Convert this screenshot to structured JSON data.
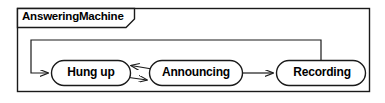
{
  "diagram": {
    "kind": "state-machine-diagram",
    "title": "AnsweringMachine",
    "frame": {
      "x": 17,
      "y": 8,
      "width": 353,
      "height": 84,
      "border_color": "#1a1a1a",
      "fill_color": "#ffffff"
    },
    "title_tab": {
      "x": 17,
      "y": 8,
      "width": 117,
      "height": 19,
      "notch": 9,
      "border_color": "#1a1a1a"
    },
    "states": [
      {
        "id": "hung-up",
        "label": "Hung up",
        "x": 51,
        "y": 60,
        "width": 80,
        "height": 26,
        "shape": "rounded-rectangle",
        "border_color": "#1a1a1a",
        "fill_color": "#ffffff"
      },
      {
        "id": "announcing",
        "label": "Announcing",
        "x": 149,
        "y": 60,
        "width": 94,
        "height": 26,
        "shape": "rounded-rectangle",
        "border_color": "#1a1a1a",
        "fill_color": "#ffffff"
      },
      {
        "id": "recording",
        "label": "Recording",
        "x": 276,
        "y": 60,
        "width": 90,
        "height": 26,
        "shape": "rounded-rectangle",
        "border_color": "#1a1a1a",
        "fill_color": "#ffffff"
      }
    ],
    "transitions": [
      {
        "id": "hung-up-to-announcing",
        "from": "hung-up",
        "to": "announcing",
        "label": "",
        "path": "M 131 76 L 150 79",
        "arrow_at": "announcing"
      },
      {
        "id": "announcing-to-hung-up",
        "from": "announcing",
        "to": "hung-up",
        "label": "",
        "path": "M 150 69 L 131 66",
        "arrow_at": "hung-up"
      },
      {
        "id": "announcing-to-recording",
        "from": "announcing",
        "to": "recording",
        "label": "",
        "path": "M 243 73 L 275 73",
        "arrow_at": "recording"
      },
      {
        "id": "recording-to-hung-up",
        "from": "recording",
        "to": "hung-up",
        "label": "",
        "path": "M 321 60 L 321 40 L 31 40 L 31 73 L 50 73",
        "arrow_at": "hung-up"
      }
    ],
    "line_color": "#1a1a1a",
    "stroke_width": 1.2
  }
}
